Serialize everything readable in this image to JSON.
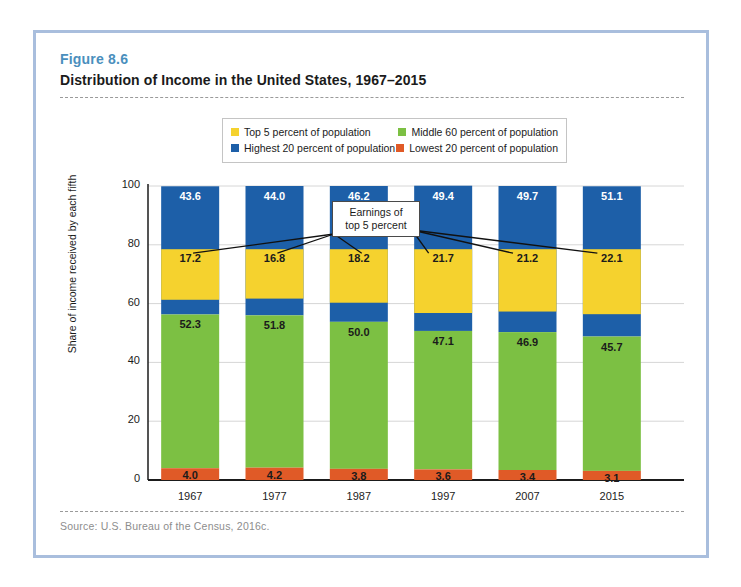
{
  "figure": {
    "number": "Figure 8.6",
    "title": "Distribution of Income in the United States, 1967–2015",
    "source": "Source: U.S. Bureau of the Census, 2016c."
  },
  "legend": {
    "items": [
      {
        "label": "Top 5 percent of population",
        "color": "#f5d22e"
      },
      {
        "label": "Middle 60 percent of population",
        "color": "#7cc043"
      },
      {
        "label": "Highest 20 percent of population",
        "color": "#1d5fa8"
      },
      {
        "label": "Lowest 20 percent of population",
        "color": "#e05a27"
      }
    ]
  },
  "annotation": {
    "line1": "Earnings of",
    "line2": "top 5 percent"
  },
  "chart_data": {
    "type": "bar",
    "title": "Distribution of Income in the United States, 1967–2015",
    "subtitle": "",
    "xlabel": "",
    "ylabel": "Share of income received by each fifth",
    "categories": [
      "1967",
      "1977",
      "1987",
      "1997",
      "2007",
      "2015"
    ],
    "ylim": [
      0,
      100
    ],
    "yticks": [
      "0",
      "20",
      "40",
      "60",
      "80",
      "100"
    ],
    "ytick_values": [
      0,
      20,
      40,
      60,
      80,
      100
    ],
    "grid": true,
    "legend_position": "top-center",
    "stacked": true,
    "series": [
      {
        "name": "Lowest 20 percent of population",
        "color": "#e05a27",
        "values": [
          4.0,
          4.2,
          3.8,
          3.6,
          3.4,
          3.1
        ],
        "labels": [
          "4.0",
          "4.2",
          "3.8",
          "3.6",
          "3.4",
          "3.1"
        ]
      },
      {
        "name": "Middle 60 percent of population",
        "color": "#7cc043",
        "values": [
          52.3,
          51.8,
          50.0,
          47.1,
          46.9,
          45.7
        ],
        "labels": [
          "52.3",
          "51.8",
          "50.0",
          "47.1",
          "46.9",
          "45.7"
        ]
      },
      {
        "name": "Highest 20 percent of population",
        "color": "#1d5fa8",
        "values": [
          43.6,
          44.0,
          46.2,
          49.4,
          49.7,
          51.1
        ],
        "labels": [
          "43.6",
          "44.0",
          "46.2",
          "49.4",
          "49.7",
          "51.1"
        ]
      },
      {
        "name": "Top 5 percent of population",
        "color": "#f5d22e",
        "overlay": true,
        "values": [
          17.2,
          16.8,
          18.2,
          21.7,
          21.2,
          22.1
        ],
        "labels": [
          "17.2",
          "16.8",
          "18.2",
          "21.7",
          "21.2",
          "22.1"
        ]
      }
    ]
  }
}
